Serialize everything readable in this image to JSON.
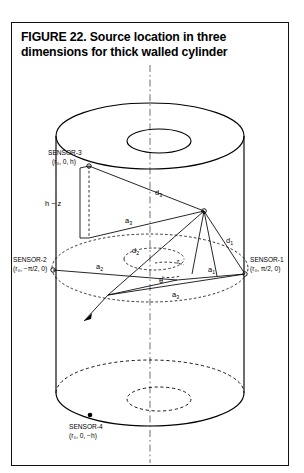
{
  "figure": {
    "caption_line1": "FIGURE 22. Source location in three dimensions",
    "caption_line2": "for thick walled cylinder"
  },
  "sensors": [
    {
      "id": "sensor-3",
      "name": "SENSOR-3",
      "coordinates": "(r₀, 0, h)",
      "position": "top"
    },
    {
      "id": "sensor-2",
      "name": "SENSOR-2",
      "coordinates": "(r₀, −π/2, 0)",
      "position": "left"
    },
    {
      "id": "sensor-1",
      "name": "SENSOR-1",
      "coordinates": "(r₀, π/2, 0)",
      "position": "right"
    },
    {
      "id": "sensor-4",
      "name": "SENSOR-4",
      "coordinates": "(r₀, 0, −h)",
      "position": "bottom"
    }
  ],
  "dimension_labels": {
    "height_offset": "h − z",
    "d1": "d",
    "d1_sub": "1",
    "d2": "d",
    "d2_sub": "2",
    "d3": "d",
    "d3_sub": "3",
    "a1": "a",
    "a1_sub": "1",
    "a2": "a",
    "a2_sub": "2",
    "a3": "a",
    "a3_sub": "3",
    "radius": "r",
    "angle": "θ"
  },
  "colors": {
    "stroke": "#000000",
    "axis": "#555555",
    "background": "#ffffff",
    "border": "#111111"
  }
}
